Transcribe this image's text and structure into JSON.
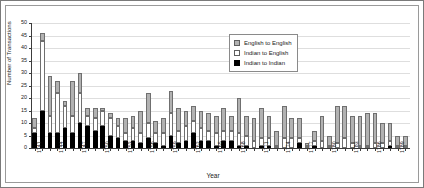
{
  "chart_data": {
    "type": "bar",
    "stacked": true,
    "title": "",
    "xlabel": "Year",
    "ylabel": "Number of Transactions",
    "ylim": [
      0,
      50
    ],
    "ytick_step": 5,
    "yticks": [
      0,
      5,
      10,
      15,
      20,
      25,
      30,
      35,
      40,
      45,
      50
    ],
    "grid": true,
    "grid_axis": "y",
    "legend_position": "top-right",
    "legend_entries": [
      "English to English",
      "Indian to English",
      "Indian to Indian"
    ],
    "colors": {
      "english_to_english": "#b2b2b2",
      "indian_to_english": "#ffffff",
      "indian_to_indian": "#000000",
      "axis": "#3c3c3c",
      "grid": "#dedede"
    },
    "categories": [
      "1741",
      "1742",
      "1743",
      "1744",
      "1745",
      "1746",
      "1747",
      "1748",
      "1749",
      "1750",
      "1751",
      "1752",
      "1753",
      "1754",
      "1755",
      "1756",
      "1757",
      "1758",
      "1759",
      "1760",
      "1761",
      "1762",
      "1763",
      "1764",
      "1765",
      "1766",
      "1767",
      "1768",
      "1769",
      "1770",
      "1771",
      "1772",
      "1773",
      "1774",
      "1775",
      "1776",
      "1777",
      "1778",
      "1779",
      "1780",
      "1781",
      "1782",
      "1783",
      "1784",
      "1785",
      "1786",
      "1787",
      "1788",
      "1789",
      "1790"
    ],
    "xtick_labels_shown": [
      "1741",
      "1744",
      "1747",
      "1750",
      "1753",
      "1756",
      "1759",
      "1762",
      "1765",
      "1768",
      "1771",
      "1774",
      "1777",
      "1780",
      "1783",
      "1786",
      "1789"
    ],
    "series": [
      {
        "name": "Indian to Indian",
        "key": "indian_to_indian",
        "color": "#000000",
        "values": [
          6,
          15,
          6,
          6,
          8,
          6,
          10,
          9,
          7,
          9,
          5,
          4,
          3,
          3,
          2,
          4,
          2,
          1,
          5,
          2,
          3,
          6,
          3,
          3,
          1,
          3,
          3,
          1,
          1,
          0,
          1,
          1,
          0,
          0,
          0,
          2,
          0,
          1,
          0,
          0,
          0,
          0,
          0,
          0,
          0,
          0,
          0,
          1,
          0,
          0
        ]
      },
      {
        "name": "Indian to English",
        "key": "indian_to_english",
        "color": "#ffffff",
        "values": [
          2,
          28,
          7,
          16,
          9,
          7,
          12,
          4,
          5,
          6,
          7,
          5,
          3,
          5,
          4,
          6,
          4,
          5,
          9,
          5,
          6,
          5,
          5,
          4,
          5,
          4,
          4,
          5,
          4,
          3,
          3,
          3,
          1,
          4,
          4,
          2,
          1,
          2,
          3,
          1,
          2,
          4,
          2,
          1,
          1,
          2,
          2,
          2,
          1,
          1
        ]
      },
      {
        "name": "English to English",
        "key": "english_to_english",
        "color": "#b2b2b2",
        "values": [
          4,
          3,
          16,
          5,
          2,
          14,
          8,
          3,
          4,
          1,
          2,
          3,
          6,
          5,
          9,
          12,
          5,
          6,
          9,
          9,
          6,
          6,
          7,
          7,
          7,
          9,
          6,
          14,
          8,
          9,
          12,
          9,
          6,
          13,
          8,
          8,
          1,
          4,
          10,
          4,
          15,
          13,
          11,
          12,
          13,
          12,
          8,
          7,
          4,
          4
        ]
      }
    ],
    "totals": [
      12,
      46,
      29,
      27,
      19,
      27,
      30,
      16,
      16,
      16,
      14,
      12,
      12,
      13,
      15,
      22,
      11,
      12,
      23,
      16,
      15,
      17,
      15,
      14,
      13,
      16,
      13,
      20,
      13,
      12,
      16,
      13,
      7,
      17,
      12,
      12,
      2,
      7,
      13,
      5,
      17,
      17,
      13,
      13,
      14,
      14,
      10,
      10,
      5,
      5
    ]
  },
  "legend": {
    "items": [
      {
        "label": "English to English",
        "swatch": "ee"
      },
      {
        "label": "Indian to English",
        "swatch": "ie"
      },
      {
        "label": "Indian to Indian",
        "swatch": "ii"
      }
    ]
  },
  "axes": {
    "y_title": "Number of Transactions",
    "x_title": "Year"
  }
}
